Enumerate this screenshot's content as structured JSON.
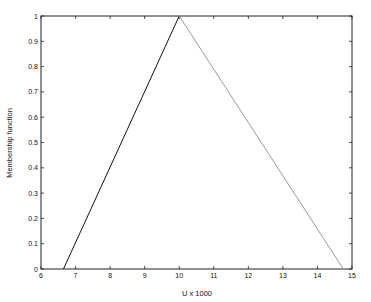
{
  "chart_data": {
    "type": "line",
    "title": "",
    "xlabel": "U x 1000",
    "ylabel": "Membership function",
    "xlim": [
      6,
      15
    ],
    "ylim": [
      0,
      1
    ],
    "x_ticks": [
      "6",
      "7",
      "8",
      "9",
      "10",
      "11",
      "12",
      "13",
      "14",
      "15"
    ],
    "y_ticks": [
      "0",
      "0.1",
      "0.2",
      "0.3",
      "0.4",
      "0.5",
      "0.6",
      "0.7",
      "0.8",
      "0.9",
      "1"
    ],
    "grid": false,
    "legend": null,
    "series": [
      {
        "name": "rising edge",
        "color": "#111111",
        "x": [
          6.65,
          10.0
        ],
        "y": [
          0,
          1
        ]
      },
      {
        "name": "falling edge",
        "color": "#9a9a9a",
        "x": [
          10.0,
          14.75
        ],
        "y": [
          1,
          0
        ]
      }
    ]
  }
}
